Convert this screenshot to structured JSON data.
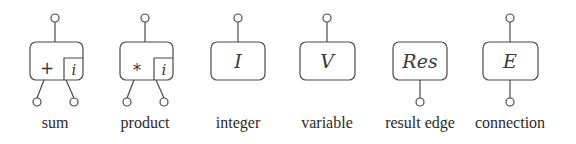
{
  "diagram": {
    "colors": {
      "stroke": "#4a4a4a",
      "text": "#2a2a2a",
      "background": "#ffffff"
    },
    "nodes": [
      {
        "id": "sum",
        "symbol": "+",
        "subscript": "i",
        "label": "sum",
        "top_port": true,
        "bottom_ports": 2
      },
      {
        "id": "product",
        "symbol": "*",
        "subscript": "i",
        "label": "product",
        "top_port": true,
        "bottom_ports": 2
      },
      {
        "id": "integer",
        "symbol": "I",
        "label": "integer",
        "top_port": true,
        "bottom_ports": 0
      },
      {
        "id": "variable",
        "symbol": "V",
        "label": "variable",
        "top_port": true,
        "bottom_ports": 0
      },
      {
        "id": "result-edge",
        "symbol": "Res",
        "label": "result edge",
        "top_port": false,
        "bottom_ports": 1
      },
      {
        "id": "connection",
        "symbol": "E",
        "label": "connection",
        "top_port": true,
        "bottom_ports": 1
      }
    ]
  }
}
